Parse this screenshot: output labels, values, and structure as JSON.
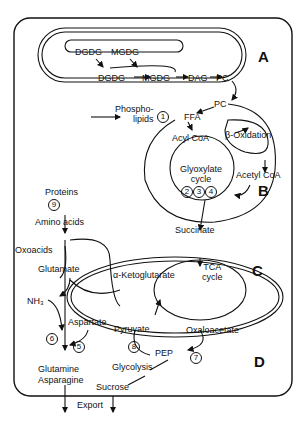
{
  "compartments": {
    "A": "A",
    "B": "B",
    "C": "C",
    "D": "D"
  },
  "labels": {
    "dgdg_top": "DGDG",
    "mgdg_top": "MGDG",
    "dgdg_mid": "DGDG",
    "mgdg_mid": "MGDG",
    "dag": "DAG",
    "pc_a": "PC",
    "pc_b": "PC",
    "phospholipids": "Phospho-\nlipids",
    "ffa": "FFA",
    "acyl_coa": "Acyl CoA",
    "beta_oxidation": "β-Oxidation",
    "glyoxylate_cycle": "Glyoxylate\ncycle",
    "acetyl_coa": "Acetyl CoA",
    "succinate": "Succinate",
    "proteins": "Proteins",
    "amino_acids": "Amino acids",
    "oxoacids": "Oxoacids",
    "glutamate": "Glutamate",
    "a_ketoglutarate": "α-Ketoglutarate",
    "tca_cycle": "TCA\ncycle",
    "nh3": "NH₃",
    "aspartate": "Aspartate",
    "pyruvate": "Pyruvate",
    "oxaloacetate": "Oxaloacetate",
    "pep": "PEP",
    "glycolysis": "Glycolysis",
    "glutamine": "Glutamine",
    "asparagine": "Asparagine",
    "sucrose": "Sucrose",
    "export": "Export"
  },
  "steps": [
    "1",
    "2",
    "3",
    "4",
    "5",
    "6",
    "7",
    "8",
    "9"
  ]
}
